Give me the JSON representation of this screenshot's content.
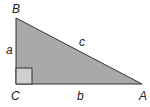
{
  "diagram": {
    "type": "right-triangle",
    "colors": {
      "fill": "#a9a9a9",
      "stroke": "#333333",
      "right_angle_fill": "#cfcfcf",
      "label": "#222222"
    },
    "vertices": {
      "B": {
        "label": "B",
        "x": 16,
        "y": 18
      },
      "C": {
        "label": "C",
        "x": 16,
        "y": 84
      },
      "A": {
        "label": "A",
        "x": 142,
        "y": 84
      }
    },
    "sides": {
      "a": {
        "label": "a",
        "between": "B-C"
      },
      "b": {
        "label": "b",
        "between": "C-A"
      },
      "c": {
        "label": "c",
        "between": "B-A"
      }
    },
    "right_angle_at": "C"
  }
}
